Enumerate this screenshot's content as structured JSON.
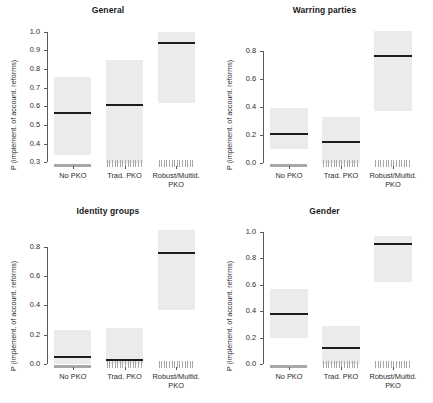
{
  "figure": {
    "ylabel": "P (implement. of account. reforms)",
    "categories": [
      "No PKO",
      "Trad. PKO",
      "Robust/Multid. PKO"
    ],
    "category_lines": [
      [
        "No PKO"
      ],
      [
        "Trad. PKO"
      ],
      [
        "Robust/Multid.",
        "PKO"
      ]
    ]
  },
  "chart_data": [
    {
      "type": "bar",
      "title": "General",
      "xlabel": "",
      "ylabel": "P (implement. of account. reforms)",
      "categories": [
        "No PKO",
        "Trad. PKO",
        "Robust/Multid. PKO"
      ],
      "values": [
        0.565,
        0.605,
        0.94
      ],
      "ci_low": [
        0.34,
        0.295,
        0.62
      ],
      "ci_high": [
        0.755,
        0.85,
        1.0
      ],
      "ylim": [
        0.28,
        1.02
      ],
      "yticks": [
        0.3,
        0.4,
        0.5,
        0.6,
        0.7,
        0.8,
        0.9,
        1.0
      ],
      "ytick_labels": [
        "0.3",
        "0.4",
        "0.5",
        "0.6",
        "0.7",
        "0.8",
        "0.9",
        "1.0"
      ],
      "grid": false,
      "legend": "none"
    },
    {
      "type": "bar",
      "title": "Warring parties",
      "xlabel": "",
      "ylabel": "P (implement. of account. reforms)",
      "categories": [
        "No PKO",
        "Trad. PKO",
        "Robust/Multid. PKO"
      ],
      "values": [
        0.21,
        0.15,
        0.76
      ],
      "ci_low": [
        0.1,
        0.0,
        0.37
      ],
      "ci_high": [
        0.39,
        0.33,
        0.94
      ],
      "ylim": [
        -0.02,
        0.96
      ],
      "yticks": [
        0.0,
        0.2,
        0.4,
        0.6,
        0.8
      ],
      "ytick_labels": [
        "0.0",
        "0.2",
        "0.4",
        "0.6",
        "0.8"
      ],
      "grid": false,
      "legend": "none"
    },
    {
      "type": "bar",
      "title": "Identity groups",
      "xlabel": "",
      "ylabel": "P (implement. of account. reforms)",
      "categories": [
        "No PKO",
        "Trad. PKO",
        "Robust/Multid. PKO"
      ],
      "values": [
        0.045,
        0.03,
        0.755
      ],
      "ci_low": [
        0.0,
        0.0,
        0.37
      ],
      "ci_high": [
        0.235,
        0.245,
        0.91
      ],
      "ylim": [
        -0.02,
        0.92
      ],
      "yticks": [
        0.0,
        0.2,
        0.4,
        0.6,
        0.8
      ],
      "ytick_labels": [
        "0.0",
        "0.2",
        "0.4",
        "0.6",
        "0.8"
      ],
      "grid": false,
      "legend": "none"
    },
    {
      "type": "bar",
      "title": "Gender",
      "xlabel": "",
      "ylabel": "P (implement. of account. reforms)",
      "categories": [
        "No PKO",
        "Trad. PKO",
        "Robust/Multid. PKO"
      ],
      "values": [
        0.38,
        0.12,
        0.91
      ],
      "ci_low": [
        0.2,
        0.0,
        0.62
      ],
      "ci_high": [
        0.565,
        0.29,
        0.97
      ],
      "ylim": [
        -0.02,
        1.02
      ],
      "yticks": [
        0.0,
        0.2,
        0.4,
        0.6,
        0.8,
        1.0
      ],
      "ytick_labels": [
        "0.0",
        "0.2",
        "0.4",
        "0.6",
        "0.8",
        "1.0"
      ],
      "grid": false,
      "legend": "none"
    }
  ]
}
